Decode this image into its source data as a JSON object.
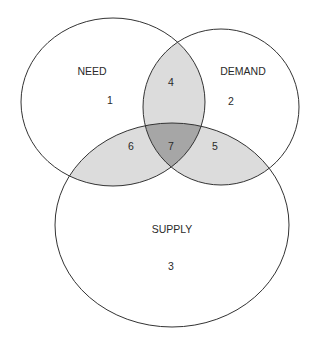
{
  "diagram": {
    "type": "venn",
    "sets": [
      {
        "id": "need",
        "label": "NEED",
        "region": "1"
      },
      {
        "id": "demand",
        "label": "DEMAND",
        "region": "2"
      },
      {
        "id": "supply",
        "label": "SUPPLY",
        "region": "3"
      }
    ],
    "regions": {
      "r1": "1",
      "r2": "2",
      "r3": "3",
      "r4": "4",
      "r5": "5",
      "r6": "6",
      "r7": "7"
    },
    "colors": {
      "stroke": "#333333",
      "pair_overlap": "#dcdcdc",
      "triple_overlap": "#a6a6a6",
      "background": "#ffffff"
    }
  }
}
